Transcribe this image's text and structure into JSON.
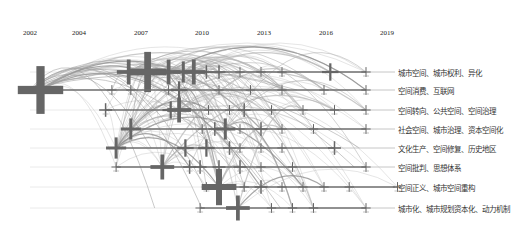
{
  "chart_data": {
    "type": "timeline",
    "title": "",
    "view": "keyword cluster timeline",
    "x_axis": {
      "years": [
        "2002",
        "2004",
        "2007",
        "2010",
        "2013",
        "2016",
        "2019"
      ],
      "range": [
        2002,
        2019
      ]
    },
    "clusters": [
      {
        "id": 0,
        "label": "城市空间、城市权利、异化",
        "start": 2006.5,
        "nodes": [
          {
            "year": 2006.7,
            "size": 5
          },
          {
            "year": 2007.6,
            "size": 9
          },
          {
            "year": 2008.6,
            "size": 5
          },
          {
            "year": 2009.3,
            "size": 4
          },
          {
            "year": 2009.8,
            "size": 5
          },
          {
            "year": 2010.4,
            "size": 2
          },
          {
            "year": 2011,
            "size": 2
          },
          {
            "year": 2012,
            "size": 1
          },
          {
            "year": 2013,
            "size": 1
          },
          {
            "year": 2014,
            "size": 1
          },
          {
            "year": 2016.3,
            "size": 3
          },
          {
            "year": 2018,
            "size": 1
          }
        ]
      },
      {
        "id": 1,
        "label": "空间消费、互联网",
        "start": 2002,
        "nodes": [
          {
            "year": 2002.5,
            "size": 11
          },
          {
            "year": 2005.9,
            "size": 1
          },
          {
            "year": 2006.8,
            "size": 1
          },
          {
            "year": 2008.6,
            "size": 1
          },
          {
            "year": 2009.1,
            "size": 3
          },
          {
            "year": 2011,
            "size": 1
          },
          {
            "year": 2012.5,
            "size": 1
          },
          {
            "year": 2014,
            "size": 1
          },
          {
            "year": 2016,
            "size": 1
          },
          {
            "year": 2018,
            "size": 1
          }
        ]
      },
      {
        "id": 2,
        "label": "空间转向、公共空间、空间治理",
        "start": 2005.5,
        "nodes": [
          {
            "year": 2005.6,
            "size": 2
          },
          {
            "year": 2008.7,
            "size": 3
          },
          {
            "year": 2009.1,
            "size": 5
          },
          {
            "year": 2010.5,
            "size": 1
          },
          {
            "year": 2011.5,
            "size": 1
          },
          {
            "year": 2012.2,
            "size": 2
          },
          {
            "year": 2013.5,
            "size": 1
          },
          {
            "year": 2015,
            "size": 1
          },
          {
            "year": 2016.5,
            "size": 1
          },
          {
            "year": 2018,
            "size": 1
          }
        ]
      },
      {
        "id": 3,
        "label": "社会空间、城市治理、资本空间化",
        "start": 2006.3,
        "nodes": [
          {
            "year": 2006.8,
            "size": 4
          },
          {
            "year": 2010.2,
            "size": 1
          },
          {
            "year": 2010.8,
            "size": 2
          },
          {
            "year": 2011.3,
            "size": 4
          },
          {
            "year": 2012,
            "size": 1
          },
          {
            "year": 2013,
            "size": 2
          },
          {
            "year": 2014,
            "size": 1
          },
          {
            "year": 2015.5,
            "size": 1
          },
          {
            "year": 2018,
            "size": 1
          }
        ]
      },
      {
        "id": 4,
        "label": "文化生产、空间修复、历史地区",
        "start": 2005.8,
        "nodes": [
          {
            "year": 2006.1,
            "size": 4
          },
          {
            "year": 2009.4,
            "size": 3
          },
          {
            "year": 2010.4,
            "size": 3
          },
          {
            "year": 2011.5,
            "size": 2
          },
          {
            "year": 2012,
            "size": 1
          },
          {
            "year": 2013,
            "size": 1
          },
          {
            "year": 2014,
            "size": 1
          },
          {
            "year": 2016.5,
            "size": 2
          }
        ]
      },
      {
        "id": 5,
        "label": "空间批判、思想体系",
        "start": 2006,
        "nodes": [
          {
            "year": 2006.1,
            "size": 1
          },
          {
            "year": 2008.3,
            "size": 5
          },
          {
            "year": 2009.6,
            "size": 2
          },
          {
            "year": 2010.1,
            "size": 2
          },
          {
            "year": 2011,
            "size": 2
          },
          {
            "year": 2012,
            "size": 2
          },
          {
            "year": 2013,
            "size": 1
          },
          {
            "year": 2014.5,
            "size": 1
          },
          {
            "year": 2018,
            "size": 1
          }
        ]
      },
      {
        "id": 6,
        "label": "空间正义、城市空间重构",
        "start": 2010,
        "nodes": [
          {
            "year": 2010.4,
            "size": 1
          },
          {
            "year": 2011,
            "size": 8
          },
          {
            "year": 2012.2,
            "size": 1
          },
          {
            "year": 2013,
            "size": 2
          },
          {
            "year": 2014,
            "size": 1
          },
          {
            "year": 2015,
            "size": 1
          },
          {
            "year": 2016,
            "size": 1
          },
          {
            "year": 2017.2,
            "size": 1
          },
          {
            "year": 2019.5,
            "size": 1
          }
        ]
      },
      {
        "id": 7,
        "label": "城市化、城市规划资本化、动力机制",
        "start": 2010,
        "nodes": [
          {
            "year": 2010.1,
            "size": 1
          },
          {
            "year": 2011.9,
            "size": 5
          },
          {
            "year": 2013.5,
            "size": 1
          },
          {
            "year": 2014.5,
            "size": 1
          },
          {
            "year": 2015.5,
            "size": 1
          },
          {
            "year": 2018,
            "size": 1
          }
        ]
      }
    ],
    "legend_position": "right",
    "grid": false,
    "node_color": "#666666",
    "line_color": "#6f6f6f",
    "arc_color": "#9a9a9a"
  }
}
